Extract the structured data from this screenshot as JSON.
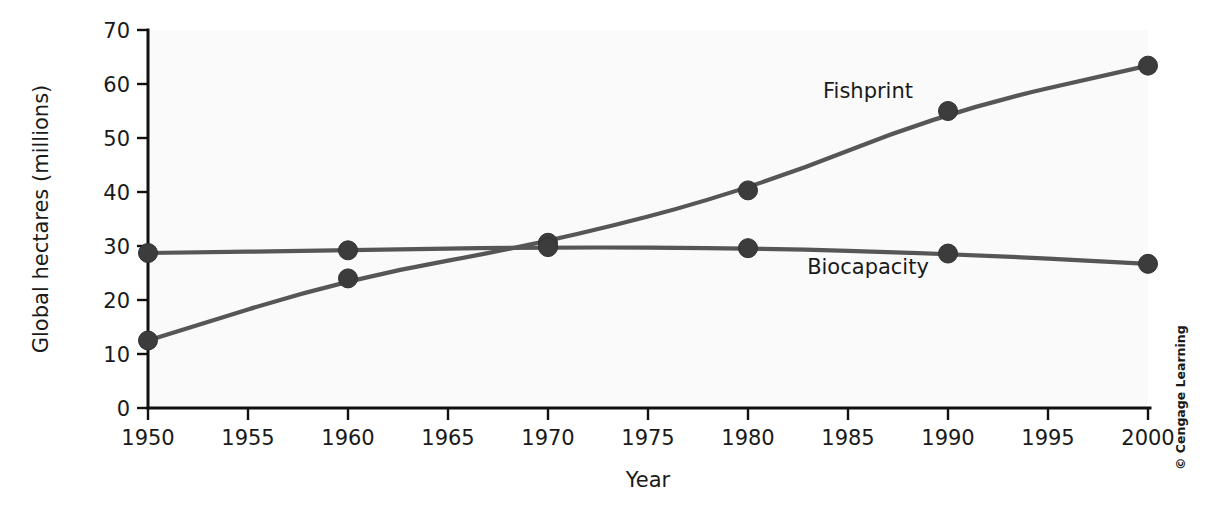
{
  "chart_data": {
    "type": "line",
    "title": "",
    "xlabel": "Year",
    "ylabel": "Global hectares (millions)",
    "xlim": [
      1950,
      2000
    ],
    "ylim": [
      0,
      70
    ],
    "grid": false,
    "legend_position": "inline-annotation",
    "x": [
      1950,
      1960,
      1970,
      1980,
      1990,
      2000
    ],
    "xticks": [
      1950,
      1955,
      1960,
      1965,
      1970,
      1975,
      1980,
      1985,
      1990,
      1995,
      2000
    ],
    "xtick_labels": [
      "1950",
      "1955",
      "1960",
      "1965",
      "1970",
      "1975",
      "1980",
      "1985",
      "1990",
      "1995",
      "2000"
    ],
    "yticks": [
      0,
      10,
      20,
      30,
      40,
      50,
      60,
      70
    ],
    "ytick_labels": [
      "0",
      "10",
      "20",
      "30",
      "40",
      "50",
      "60",
      "70"
    ],
    "series": [
      {
        "name": "Fishprint",
        "values": [
          12.5,
          24.0,
          30.6,
          40.3,
          55.0,
          63.4
        ],
        "color": "#565656",
        "label_x": 1986,
        "label_y": 57.5
      },
      {
        "name": "Biocapacity",
        "values": [
          28.7,
          29.2,
          29.8,
          29.6,
          28.6,
          26.7
        ],
        "color": "#565656",
        "label_x": 1986,
        "label_y": 24.8
      }
    ]
  },
  "credit": {
    "text": "© Cengage Learning"
  },
  "colors": {
    "plot_background": "#fafafa",
    "page_background": "#ffffff",
    "axis": "#111111",
    "line": "#565656",
    "marker": "#3c3c3c",
    "text": "#1a1a1a"
  }
}
